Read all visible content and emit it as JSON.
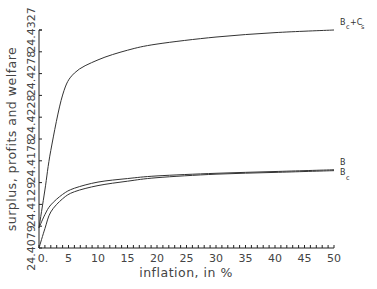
{
  "chart_data": {
    "type": "line",
    "title": "",
    "xlabel": "inflation, in %",
    "ylabel": "surplus, profits and welfare",
    "xlim": [
      0,
      50
    ],
    "ylim": [
      24.4079,
      24.4327
    ],
    "grid": false,
    "legend_position": "inline-right",
    "x_ticks": [
      "0.",
      "5",
      "10",
      "15",
      "20",
      "25",
      "30",
      "35",
      "40",
      "45",
      "50"
    ],
    "y_ticks": [
      "24.4079",
      "24.4129",
      "24.4178",
      "24.4228",
      "24.4278",
      "24.4327"
    ],
    "x": [
      0,
      1,
      2,
      4,
      6,
      10,
      15,
      20,
      30,
      40,
      50
    ],
    "series": [
      {
        "name": "B_c+C_s",
        "label_main": "B",
        "label_sub1": "c",
        "label_plus": "+C",
        "label_sub2": "s",
        "values": [
          24.4102,
          24.4145,
          24.419,
          24.4253,
          24.4278,
          24.4293,
          24.4304,
          24.4311,
          24.4319,
          24.4324,
          24.4327
        ]
      },
      {
        "name": "B",
        "label_main": "B",
        "values": [
          24.4102,
          24.4117,
          24.4128,
          24.414,
          24.4147,
          24.4154,
          24.4158,
          24.4161,
          24.4164,
          24.4166,
          24.4168
        ]
      },
      {
        "name": "B_c",
        "label_main": "B",
        "label_sub1": "c",
        "values": [
          24.4079,
          24.4101,
          24.412,
          24.4135,
          24.4143,
          24.415,
          24.4155,
          24.4159,
          24.4163,
          24.4165,
          24.4167
        ]
      }
    ]
  }
}
